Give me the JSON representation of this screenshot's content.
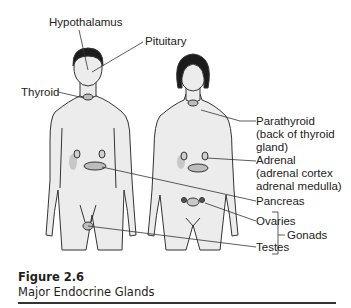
{
  "figure": {
    "number": "Figure 2.6",
    "title": "Major Endocrine Glands"
  },
  "labels": {
    "hypothalamus": "Hypothalamus",
    "pituitary": "Pituitary",
    "thyroid": "Thyroid",
    "parathyroid": [
      "Parathyroid",
      "(back of thyroid",
      "gland)"
    ],
    "adrenal": [
      "Adrenal",
      "(adrenal cortex",
      "adrenal medulla)"
    ],
    "pancreas": "Pancreas",
    "ovaries": "Ovaries",
    "testes": "Testes",
    "gonads": "Gonads"
  },
  "colors": {
    "skin": "#ececec",
    "outline": "#333333",
    "hair": "#1c1c1c",
    "gland": "#bdbdbd"
  }
}
